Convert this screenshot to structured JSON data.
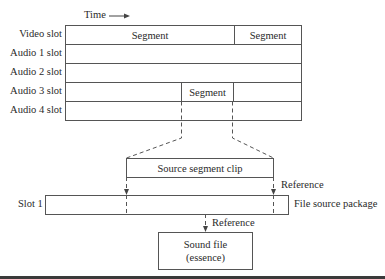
{
  "time_label": "Time",
  "track_grid": {
    "slots": [
      {
        "label": "Video slot",
        "segments": [
          "Segment",
          "Segment"
        ]
      },
      {
        "label": "Audio 1 slot",
        "segments": []
      },
      {
        "label": "Audio 2 slot",
        "segments": []
      },
      {
        "label": "Audio 3 slot",
        "segments": [
          "Segment"
        ]
      },
      {
        "label": "Audio 4 slot",
        "segments": []
      }
    ]
  },
  "source_clip": {
    "label": "Source segment clip"
  },
  "file_source": {
    "slot_label": "Slot 1",
    "package_label": "File source package",
    "reference_label": "Reference"
  },
  "sound_file": {
    "line1": "Sound file",
    "line2": "(essence)",
    "reference_label": "Reference"
  },
  "colors": {
    "line": "#555555",
    "text": "#2a2a2a"
  }
}
